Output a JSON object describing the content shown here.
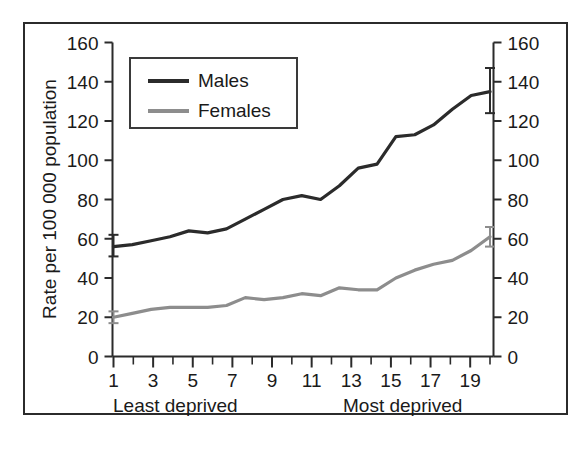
{
  "figure": {
    "background_color": "#ffffff",
    "frame_color": "#2b2b2b",
    "x_axis_note_left": "Least deprived",
    "x_axis_note_right": "Most deprived"
  },
  "legend": {
    "position": "top-left-inside",
    "entries": [
      {
        "label": "Males",
        "color": "#2b2b2b"
      },
      {
        "label": "Females",
        "color": "#8d8d8d"
      }
    ]
  },
  "chart_data": {
    "type": "line",
    "title": "",
    "subtitle": "",
    "xlabel": "",
    "ylabel": "Rate per 100 000 population",
    "xlim": [
      0.4,
      20.6
    ],
    "ylim": [
      0,
      160
    ],
    "grid": false,
    "legend_position": "top-left",
    "x": [
      1,
      2,
      3,
      4,
      5,
      6,
      7,
      8,
      9,
      10,
      11,
      12,
      13,
      14,
      15,
      16,
      17,
      18,
      19,
      20
    ],
    "x_tick_values": [
      1,
      2,
      3,
      4,
      5,
      6,
      7,
      8,
      9,
      10,
      11,
      12,
      13,
      14,
      15,
      16,
      17,
      18,
      19,
      20
    ],
    "x_tick_labels": [
      "1",
      "",
      "3",
      "",
      "5",
      "",
      "7",
      "",
      "9",
      "",
      "11",
      "",
      "13",
      "",
      "15",
      "",
      "17",
      "",
      "19",
      ""
    ],
    "y_tick_values": [
      0,
      20,
      40,
      60,
      80,
      100,
      120,
      140,
      160
    ],
    "y_tick_labels": [
      "0",
      "20",
      "40",
      "60",
      "80",
      "100",
      "120",
      "140",
      "160"
    ],
    "y_axis_right_tick_labels": [
      "0",
      "20",
      "40",
      "60",
      "80",
      "100",
      "120",
      "140",
      "160"
    ],
    "series": [
      {
        "name": "Males",
        "color": "#2b2b2b",
        "line_width": 3.2,
        "values": [
          56,
          58,
          60,
          62,
          64,
          63,
          66,
          70,
          74,
          75,
          76,
          80,
          84,
          88,
          95,
          99,
          98,
          104,
          110,
          113
        ],
        "error_bars": [
          {
            "x": 1,
            "value": 56,
            "low": 51,
            "high": 62
          },
          {
            "x": 20,
            "value": 135,
            "low": 124,
            "high": 147
          }
        ]
      },
      {
        "name": "Females",
        "color": "#8d8d8d",
        "line_width": 3.2,
        "values": [
          20,
          22,
          24,
          25,
          25,
          25,
          26,
          30,
          29,
          30,
          31,
          31,
          35,
          34,
          36,
          40,
          44,
          47,
          49,
          54
        ],
        "error_bars": [
          {
            "x": 1,
            "value": 20,
            "low": 17,
            "high": 23
          },
          {
            "x": 20,
            "value": 61,
            "low": 56,
            "high": 66
          }
        ]
      }
    ],
    "series_full": {
      "males": [
        56,
        57,
        59,
        61,
        64,
        63,
        65,
        70,
        75,
        80,
        82,
        80,
        87,
        96,
        98,
        112,
        113,
        118,
        126,
        133,
        135
      ],
      "females": [
        20,
        22,
        24,
        25,
        25,
        25,
        26,
        30,
        29,
        30,
        32,
        31,
        35,
        34,
        34,
        40,
        44,
        47,
        49,
        54,
        61
      ]
    }
  }
}
